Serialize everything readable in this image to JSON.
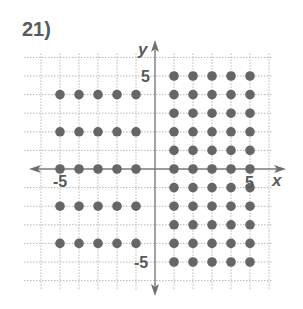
{
  "problem": {
    "number_label": "21)"
  },
  "chart_data": {
    "type": "scatter",
    "title": "",
    "xlabel": "x",
    "ylabel": "y",
    "xlim": [
      -7,
      6
    ],
    "ylim": [
      -6,
      6
    ],
    "grid": true,
    "tick_labels": {
      "x": [
        {
          "value": -5,
          "label": "-5"
        },
        {
          "value": 5,
          "label": "5"
        }
      ],
      "y": [
        {
          "value": 5,
          "label": "5"
        },
        {
          "value": -5,
          "label": "-5"
        }
      ]
    },
    "series": [
      {
        "name": "left region",
        "description": "x from -5 to -1, y even values 4, 2, 0, -2, -4",
        "points": [
          [
            -5,
            4
          ],
          [
            -4,
            4
          ],
          [
            -3,
            4
          ],
          [
            -2,
            4
          ],
          [
            -1,
            4
          ],
          [
            -5,
            2
          ],
          [
            -4,
            2
          ],
          [
            -3,
            2
          ],
          [
            -2,
            2
          ],
          [
            -1,
            2
          ],
          [
            -5,
            0
          ],
          [
            -4,
            0
          ],
          [
            -3,
            0
          ],
          [
            -2,
            0
          ],
          [
            -1,
            0
          ],
          [
            -5,
            -2
          ],
          [
            -4,
            -2
          ],
          [
            -3,
            -2
          ],
          [
            -2,
            -2
          ],
          [
            -1,
            -2
          ],
          [
            -5,
            -4
          ],
          [
            -4,
            -4
          ],
          [
            -3,
            -4
          ],
          [
            -2,
            -4
          ],
          [
            -1,
            -4
          ]
        ]
      },
      {
        "name": "right region",
        "description": "x from 1 to 5, y all integers from 5 to -5",
        "points": [
          [
            1,
            5
          ],
          [
            2,
            5
          ],
          [
            3,
            5
          ],
          [
            4,
            5
          ],
          [
            5,
            5
          ],
          [
            1,
            4
          ],
          [
            2,
            4
          ],
          [
            3,
            4
          ],
          [
            4,
            4
          ],
          [
            5,
            4
          ],
          [
            1,
            3
          ],
          [
            2,
            3
          ],
          [
            3,
            3
          ],
          [
            4,
            3
          ],
          [
            5,
            3
          ],
          [
            1,
            2
          ],
          [
            2,
            2
          ],
          [
            3,
            2
          ],
          [
            4,
            2
          ],
          [
            5,
            2
          ],
          [
            1,
            1
          ],
          [
            2,
            1
          ],
          [
            3,
            1
          ],
          [
            4,
            1
          ],
          [
            5,
            1
          ],
          [
            1,
            0
          ],
          [
            2,
            0
          ],
          [
            3,
            0
          ],
          [
            4,
            0
          ],
          [
            5,
            0
          ],
          [
            1,
            -1
          ],
          [
            2,
            -1
          ],
          [
            3,
            -1
          ],
          [
            4,
            -1
          ],
          [
            5,
            -1
          ],
          [
            1,
            -2
          ],
          [
            2,
            -2
          ],
          [
            3,
            -2
          ],
          [
            4,
            -2
          ],
          [
            5,
            -2
          ],
          [
            1,
            -3
          ],
          [
            2,
            -3
          ],
          [
            3,
            -3
          ],
          [
            4,
            -3
          ],
          [
            5,
            -3
          ],
          [
            1,
            -4
          ],
          [
            2,
            -4
          ],
          [
            3,
            -4
          ],
          [
            4,
            -4
          ],
          [
            5,
            -4
          ],
          [
            1,
            -5
          ],
          [
            2,
            -5
          ],
          [
            3,
            -5
          ],
          [
            4,
            -5
          ],
          [
            5,
            -5
          ]
        ]
      }
    ],
    "colors": {
      "dot": "#666666",
      "axis": "#7a7a7a",
      "grid": "#b8b8b8",
      "label": "#5a5a5a"
    }
  }
}
